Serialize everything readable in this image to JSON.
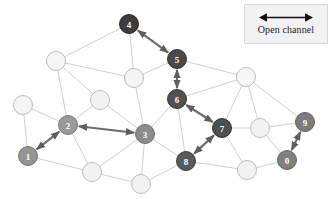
{
  "figure": {
    "width": 332,
    "height": 199,
    "background": "#ffffff"
  },
  "legend": {
    "label": "Open channel",
    "icon": "double-headed-arrow-icon",
    "arrow_color": "#111111",
    "box_fill": "#f2f2f2",
    "box_border": "#d8d8d8"
  },
  "graph": {
    "type": "network-diagram",
    "node_radius": 9.5,
    "plain_node": {
      "fill": "#f7f7f7",
      "stroke": "#b3b3b3"
    },
    "edge_color": "#c9c9c9",
    "edge_width": 0.9,
    "path_edge_color": "#6e6e6e",
    "path_edge_width": 2.2,
    "nodes": [
      {
        "id": "n0",
        "label": "0",
        "x": 287,
        "y": 160,
        "fill": "#808080",
        "stroke": "#5a5a5a",
        "labeled": true
      },
      {
        "id": "n1",
        "label": "1",
        "x": 28,
        "y": 156,
        "fill": "#949494",
        "stroke": "#6d6d6d",
        "labeled": true
      },
      {
        "id": "n2",
        "label": "2",
        "x": 68,
        "y": 125,
        "fill": "#9a9a9a",
        "stroke": "#737373",
        "labeled": true
      },
      {
        "id": "n3",
        "label": "3",
        "x": 145,
        "y": 134,
        "fill": "#8c8c8c",
        "stroke": "#666666",
        "labeled": true
      },
      {
        "id": "n4",
        "label": "4",
        "x": 129,
        "y": 24,
        "fill": "#3c3c3c",
        "stroke": "#1f1f1f",
        "labeled": true
      },
      {
        "id": "n5",
        "label": "5",
        "x": 177,
        "y": 59,
        "fill": "#4a4a4a",
        "stroke": "#262626",
        "labeled": true
      },
      {
        "id": "n6",
        "label": "6",
        "x": 177,
        "y": 99,
        "fill": "#515151",
        "stroke": "#2b2b2b",
        "labeled": true
      },
      {
        "id": "n7",
        "label": "7",
        "x": 222,
        "y": 128,
        "fill": "#4f4f4f",
        "stroke": "#2a2a2a",
        "labeled": true
      },
      {
        "id": "n8",
        "label": "8",
        "x": 186,
        "y": 161,
        "fill": "#5a5a5a",
        "stroke": "#323232",
        "labeled": true
      },
      {
        "id": "n9",
        "label": "9",
        "x": 305,
        "y": 122,
        "fill": "#7d7d7d",
        "stroke": "#575757",
        "labeled": true
      },
      {
        "id": "u1",
        "label": "",
        "x": 56,
        "y": 61,
        "fill": "#f7f7f7",
        "stroke": "#b3b3b3",
        "labeled": false
      },
      {
        "id": "u2",
        "label": "",
        "x": 134,
        "y": 78,
        "fill": "#f4f4f4",
        "stroke": "#b3b3b3",
        "labeled": false
      },
      {
        "id": "u3",
        "label": "",
        "x": 100,
        "y": 100,
        "fill": "#f2f2f2",
        "stroke": "#b6b6b6",
        "labeled": false
      },
      {
        "id": "u4",
        "label": "",
        "x": 23,
        "y": 105,
        "fill": "#f5f5f5",
        "stroke": "#b3b3b3",
        "labeled": false
      },
      {
        "id": "u5",
        "label": "",
        "x": 92,
        "y": 172,
        "fill": "#f2f2f2",
        "stroke": "#b6b6b6",
        "labeled": false
      },
      {
        "id": "u6",
        "label": "",
        "x": 141,
        "y": 184,
        "fill": "#f2f2f2",
        "stroke": "#b6b6b6",
        "labeled": false
      },
      {
        "id": "u7",
        "label": "",
        "x": 246,
        "y": 77,
        "fill": "#f7f7f7",
        "stroke": "#b3b3b3",
        "labeled": false
      },
      {
        "id": "u8",
        "label": "",
        "x": 260,
        "y": 128,
        "fill": "#f2f2f2",
        "stroke": "#b6b6b6",
        "labeled": false
      },
      {
        "id": "u9",
        "label": "",
        "x": 247,
        "y": 170,
        "fill": "#f2f2f2",
        "stroke": "#b6b6b6",
        "labeled": false
      }
    ],
    "edges": [
      {
        "from": "n4",
        "to": "u1"
      },
      {
        "from": "n4",
        "to": "u2"
      },
      {
        "from": "n4",
        "to": "n5"
      },
      {
        "from": "u1",
        "to": "u2"
      },
      {
        "from": "u1",
        "to": "u3"
      },
      {
        "from": "u1",
        "to": "n2"
      },
      {
        "from": "u2",
        "to": "n5"
      },
      {
        "from": "u2",
        "to": "n3"
      },
      {
        "from": "u3",
        "to": "n3"
      },
      {
        "from": "u3",
        "to": "n2"
      },
      {
        "from": "u4",
        "to": "n2"
      },
      {
        "from": "u4",
        "to": "n1"
      },
      {
        "from": "n1",
        "to": "n2"
      },
      {
        "from": "n1",
        "to": "u5"
      },
      {
        "from": "n2",
        "to": "n3"
      },
      {
        "from": "n2",
        "to": "u5"
      },
      {
        "from": "u5",
        "to": "n3"
      },
      {
        "from": "u5",
        "to": "u6"
      },
      {
        "from": "n3",
        "to": "u6"
      },
      {
        "from": "n3",
        "to": "n6"
      },
      {
        "from": "n3",
        "to": "n8"
      },
      {
        "from": "n5",
        "to": "n6"
      },
      {
        "from": "n5",
        "to": "u7"
      },
      {
        "from": "n6",
        "to": "n7"
      },
      {
        "from": "n6",
        "to": "n8"
      },
      {
        "from": "n6",
        "to": "u7"
      },
      {
        "from": "u6",
        "to": "n8"
      },
      {
        "from": "n8",
        "to": "n7"
      },
      {
        "from": "n8",
        "to": "u9"
      },
      {
        "from": "n7",
        "to": "u7"
      },
      {
        "from": "n7",
        "to": "u8"
      },
      {
        "from": "n7",
        "to": "u9"
      },
      {
        "from": "u7",
        "to": "u8"
      },
      {
        "from": "u7",
        "to": "n9"
      },
      {
        "from": "u8",
        "to": "n9"
      },
      {
        "from": "u8",
        "to": "n0"
      },
      {
        "from": "u9",
        "to": "n0"
      },
      {
        "from": "n0",
        "to": "n9"
      }
    ],
    "channel_edges": [
      {
        "from": "n4",
        "to": "n5",
        "arrows": "both"
      },
      {
        "from": "n5",
        "to": "n6",
        "arrows": "both"
      },
      {
        "from": "n6",
        "to": "n7",
        "arrows": "both"
      },
      {
        "from": "n7",
        "to": "n8",
        "arrows": "both"
      },
      {
        "from": "n3",
        "to": "n2",
        "arrows": "both"
      },
      {
        "from": "n1",
        "to": "n2",
        "arrows": "both"
      },
      {
        "from": "n0",
        "to": "n9",
        "arrows": "both"
      }
    ]
  }
}
